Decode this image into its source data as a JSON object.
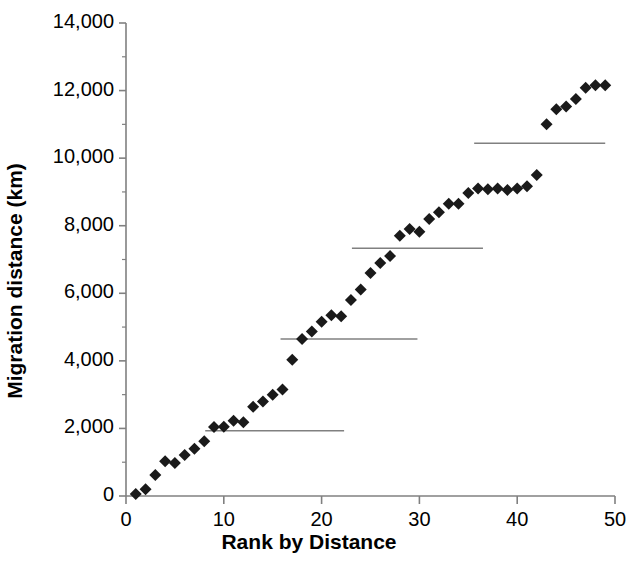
{
  "chart_data": {
    "type": "scatter",
    "title": "",
    "xlabel": "Rank by Distance",
    "ylabel": "Migration distance (km)",
    "xlim": [
      0,
      50
    ],
    "ylim": [
      0,
      14000
    ],
    "xticks": [
      0,
      10,
      20,
      30,
      40,
      50
    ],
    "xtick_labels": [
      "0",
      "10",
      "20",
      "30",
      "40",
      "50"
    ],
    "yticks": [
      0,
      2000,
      4000,
      6000,
      8000,
      10000,
      12000,
      14000
    ],
    "ytick_labels": [
      "0",
      "2,000",
      "4,000",
      "6,000",
      "8,000",
      "10,000",
      "12,000",
      "14,000"
    ],
    "grid": false,
    "legend": null,
    "marker": "diamond",
    "marker_color": "#1a1a1a",
    "marker_size": 9,
    "series": [
      {
        "name": "Migration distance by rank",
        "x": [
          1,
          2,
          3,
          4,
          5,
          6,
          7,
          8,
          9,
          10,
          11,
          12,
          13,
          14,
          15,
          16,
          17,
          18,
          19,
          20,
          21,
          22,
          23,
          24,
          25,
          26,
          27,
          28,
          29,
          30,
          31,
          32,
          33,
          34,
          35,
          36,
          37,
          38,
          39,
          40,
          41,
          42,
          43,
          44,
          45,
          46,
          47,
          48,
          49
        ],
        "y": [
          60,
          200,
          620,
          1030,
          980,
          1210,
          1400,
          1620,
          2040,
          2050,
          2230,
          2180,
          2640,
          2800,
          3000,
          3150,
          4030,
          4650,
          4870,
          5160,
          5350,
          5320,
          5800,
          6110,
          6600,
          6900,
          7100,
          7700,
          7900,
          7820,
          8200,
          8400,
          8650,
          8650,
          8970,
          9100,
          9080,
          9100,
          9060,
          9100,
          9170,
          9500,
          11000,
          11450,
          11530,
          11750,
          12080,
          12160,
          12160
        ]
      }
    ],
    "reference_lines": [
      {
        "name": "mean-segment-1",
        "y": 1930,
        "x_start": 8.1,
        "x_end": 22.3,
        "color": "#808080"
      },
      {
        "name": "mean-segment-2",
        "y": 4650,
        "x_start": 15.8,
        "x_end": 29.8,
        "color": "#808080"
      },
      {
        "name": "mean-segment-3",
        "y": 7330,
        "x_start": 23.1,
        "x_end": 36.5,
        "color": "#808080"
      },
      {
        "name": "mean-segment-4",
        "y": 10440,
        "x_start": 35.6,
        "x_end": 49.0,
        "color": "#808080"
      }
    ],
    "axis_color": "#808080"
  }
}
